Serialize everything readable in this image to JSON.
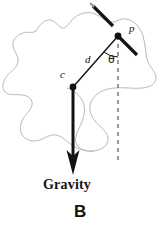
{
  "figure": {
    "panel_label": "B",
    "caption": "Gravity",
    "type": "free-body-diagram",
    "labels": {
      "pivot_point": "p",
      "center_of_mass": "c",
      "distance": "d",
      "angle": "θ"
    },
    "colors": {
      "ink": "#121212",
      "outline": "#b9b9b9",
      "background": "#ffffff",
      "dashed_line": "#6f6f6f"
    },
    "geometry": {
      "pivot_xy": [
        118,
        36
      ],
      "center_of_mass_xy": [
        73,
        87
      ],
      "gravity_arrow_tip_xy": [
        73,
        174
      ],
      "vertical_dashed_from_xy": [
        118,
        36
      ],
      "vertical_dashed_to_xy": [
        118,
        160
      ],
      "body_outline_stroke_width": 1,
      "gravity_arrow_stroke_width": 3,
      "segment_stroke_width": 3
    },
    "elements": {
      "body_outline_name": "irregular rigid body outline",
      "upper_segment_name": "upper thick line segment",
      "pivot_segment_name": "pivot thick line segment",
      "gravity_vector_name": "gravity force vector",
      "radius_line_name": "distance line from c to p",
      "vertical_reference_name": "vertical dashed reference line",
      "angle_arc_name": "theta angle arc"
    }
  }
}
